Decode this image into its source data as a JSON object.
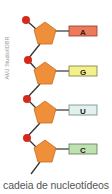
{
  "credit": "AMJ Studio/IDBR",
  "caption": "cadeia de nucleotídeos",
  "colors": {
    "sugar": "#ef8f3a",
    "sugar_stroke": "#c96a1e",
    "phosphate": "#d42a1e",
    "bond": "#333333"
  },
  "nucleotides": [
    {
      "base": "A",
      "fill": "#ee7a5c",
      "stroke": "#8a3a2a"
    },
    {
      "base": "G",
      "fill": "#f4f08c",
      "stroke": "#7a7a3a"
    },
    {
      "base": "U",
      "fill": "#e2f0ee",
      "stroke": "#6a8a86"
    },
    {
      "base": "C",
      "fill": "#bfe0b0",
      "stroke": "#5a7a50"
    }
  ]
}
